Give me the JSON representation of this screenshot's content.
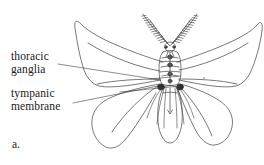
{
  "figure": {
    "caption": "a.",
    "background_color": "#ffffff",
    "ink_color": "#3a3a3a"
  },
  "labels": [
    {
      "name": "thoracic-ganglia",
      "line1": "thoracic",
      "line2": "ganglia",
      "leader_from_x": 78,
      "leader_from_y": 62,
      "leader_to_x": 160,
      "leader_to_y": 80
    },
    {
      "name": "tympanic-membrane",
      "line1": "tympanic",
      "line2": "membrane",
      "leader_from_x": 76,
      "leader_from_y": 100,
      "leader_to_x": 159,
      "leader_to_y": 86
    }
  ],
  "anatomy": {
    "forewing_left": "forewing-left",
    "forewing_right": "forewing-right",
    "hindwing_left": "hindwing-left",
    "hindwing_right": "hindwing-right",
    "thorax": "thorax",
    "abdomen": "abdomen",
    "head": "head",
    "antenna_left": "antenna-left-plumose",
    "antenna_right": "antenna-right-plumose",
    "tympanum_left": "tympanum-left",
    "tympanum_right": "tympanum-right",
    "nerve_cord": "ventral-nerve-cord",
    "legs": "legs"
  }
}
